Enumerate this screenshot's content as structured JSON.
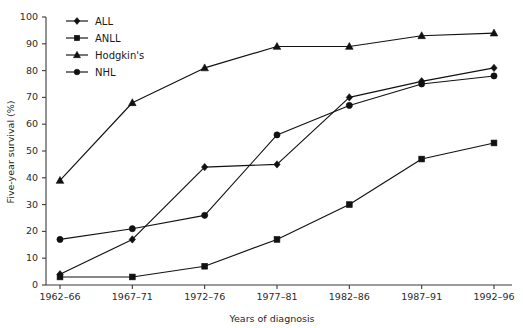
{
  "chart_data": {
    "type": "line",
    "title": "",
    "xlabel": "Years of diagnosis",
    "ylabel": "Five-year survival (%)",
    "categories": [
      "1962–66",
      "1967–71",
      "1972–76",
      "1977–81",
      "1982–86",
      "1987–91",
      "1992–96"
    ],
    "ylim": [
      0,
      100
    ],
    "yticks": [
      0,
      10,
      20,
      30,
      40,
      50,
      60,
      70,
      80,
      90,
      100
    ],
    "ytick_labels": [
      "0",
      "10",
      "20",
      "30",
      "40",
      "50",
      "60",
      "70",
      "80",
      "90",
      "100"
    ],
    "grid": false,
    "legend_position": "top-left",
    "series": [
      {
        "name": "ALL",
        "marker": "diamond",
        "values": [
          4,
          17,
          44,
          45,
          70,
          76,
          81
        ]
      },
      {
        "name": "ANLL",
        "marker": "square",
        "values": [
          3,
          3,
          7,
          17,
          30,
          47,
          53
        ]
      },
      {
        "name": "Hodgkin's",
        "marker": "triangle",
        "values": [
          39,
          68,
          81,
          89,
          89,
          93,
          94
        ]
      },
      {
        "name": "NHL",
        "marker": "circle",
        "values": [
          17,
          21,
          26,
          56,
          67,
          75,
          78
        ]
      }
    ]
  },
  "legend": {
    "items": [
      {
        "label": "ALL"
      },
      {
        "label": "ANLL"
      },
      {
        "label": "Hodgkin's"
      },
      {
        "label": "NHL"
      }
    ]
  }
}
